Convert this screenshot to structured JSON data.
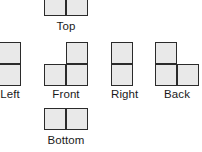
{
  "diagram": {
    "type": "orthographic-projection-views",
    "cell_size": 22,
    "colors": {
      "cell_fill": "#e9e9e9",
      "cell_stroke": "#2b2b2b",
      "label_text": "#1a1a1a",
      "background": "#ffffff"
    },
    "views": [
      {
        "id": "top",
        "label": "Top",
        "grid_cols": 2,
        "grid_rows": 1,
        "cells": [
          {
            "col": 0,
            "row": 0
          },
          {
            "col": 1,
            "row": 0
          }
        ],
        "shape_left": 44,
        "shape_top": -6,
        "label_left": 44,
        "label_top": 20
      },
      {
        "id": "left",
        "label": "Left",
        "grid_cols": 1,
        "grid_rows": 2,
        "cells": [
          {
            "col": 0,
            "row": 0
          },
          {
            "col": 0,
            "row": 1
          }
        ],
        "shape_left": -1,
        "shape_top": 42,
        "label_left": -1,
        "label_top": 88
      },
      {
        "id": "front",
        "label": "Front",
        "grid_cols": 2,
        "grid_rows": 2,
        "cells": [
          {
            "col": 1,
            "row": 0
          },
          {
            "col": 0,
            "row": 1
          },
          {
            "col": 1,
            "row": 1
          }
        ],
        "shape_left": 44,
        "shape_top": 42,
        "label_left": 44,
        "label_top": 88
      },
      {
        "id": "right",
        "label": "Right",
        "grid_cols": 1,
        "grid_rows": 2,
        "cells": [
          {
            "col": 0,
            "row": 0
          },
          {
            "col": 0,
            "row": 1
          }
        ],
        "shape_left": 111,
        "shape_top": 42,
        "label_left": 111,
        "label_top": 88
      },
      {
        "id": "back",
        "label": "Back",
        "grid_cols": 2,
        "grid_rows": 2,
        "cells": [
          {
            "col": 0,
            "row": 0
          },
          {
            "col": 0,
            "row": 1
          },
          {
            "col": 1,
            "row": 1
          }
        ],
        "shape_left": 155,
        "shape_top": 42,
        "label_left": 155,
        "label_top": 88
      },
      {
        "id": "bottom",
        "label": "Bottom",
        "grid_cols": 2,
        "grid_rows": 1,
        "cells": [
          {
            "col": 0,
            "row": 0
          },
          {
            "col": 1,
            "row": 0
          }
        ],
        "shape_left": 44,
        "shape_top": 108,
        "label_left": 44,
        "label_top": 134
      }
    ]
  }
}
